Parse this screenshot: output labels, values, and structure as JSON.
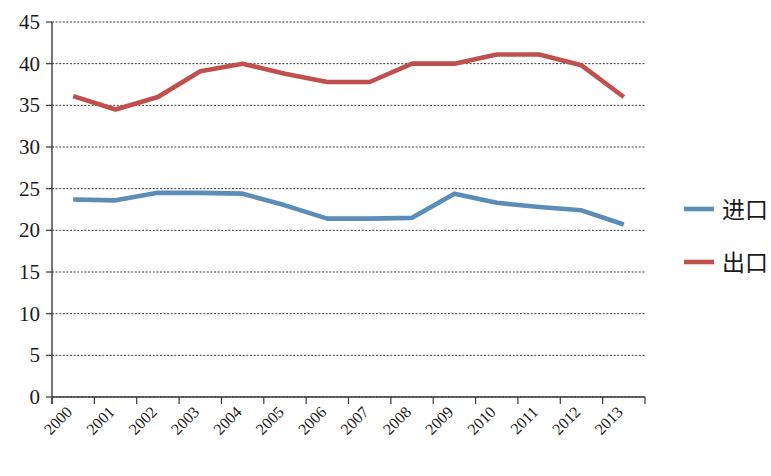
{
  "chart_data": {
    "type": "line",
    "title": "",
    "subtitle": "",
    "xlabel": "",
    "ylabel": "",
    "categories": [
      "2000",
      "2001",
      "2002",
      "2003",
      "2004",
      "2005",
      "2006",
      "2007",
      "2008",
      "2009",
      "2010",
      "2011",
      "2012",
      "2013"
    ],
    "series": [
      {
        "name": "进口",
        "color": "#5B8DB8",
        "values": [
          23.7,
          23.6,
          24.5,
          24.5,
          24.4,
          23.0,
          21.4,
          21.4,
          21.5,
          24.4,
          23.3,
          22.8,
          22.4,
          20.7
        ]
      },
      {
        "name": "出口",
        "color": "#C0504D",
        "values": [
          36.1,
          34.5,
          36.0,
          39.1,
          40.0,
          38.8,
          37.8,
          37.8,
          40.0,
          40.0,
          41.1,
          41.1,
          39.8,
          36.0
        ]
      }
    ],
    "ylim": [
      0,
      45
    ],
    "ytick_values": [
      0,
      5,
      10,
      15,
      20,
      25,
      30,
      35,
      40,
      45
    ],
    "ytick_labels": [
      "0",
      "5",
      "10",
      "15",
      "20",
      "25",
      "30",
      "35",
      "40",
      "45"
    ],
    "grid": true,
    "grid_axis": "y",
    "grid_style": "dashed",
    "legend_position": "right",
    "xtick_rotation": 45,
    "background_color": "#FFFFFF",
    "axis_color": "#3A3A3A"
  },
  "legend": {
    "items": [
      {
        "label": "进口",
        "color": "#5B8DB8"
      },
      {
        "label": "出口",
        "color": "#C0504D"
      }
    ]
  }
}
